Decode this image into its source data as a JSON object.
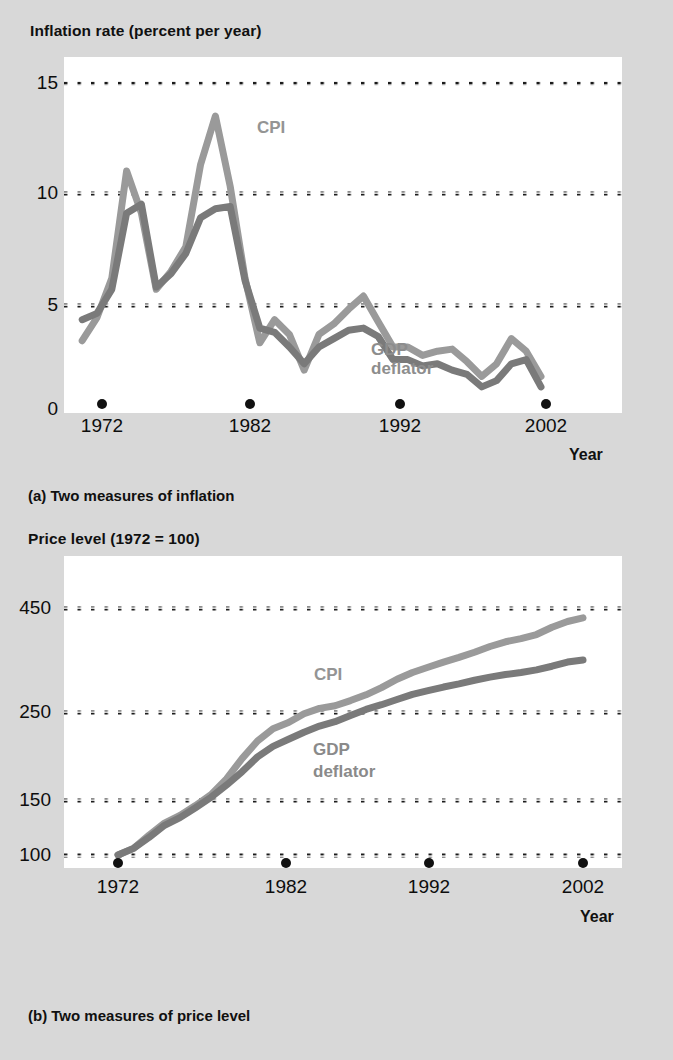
{
  "figure": {
    "background_color": "#d8d8d8",
    "plot_background": "#ffffff"
  },
  "panel_a": {
    "axis_title": "Inflation rate (percent per year)",
    "caption": "(a) Two measures of inflation",
    "x_axis_label": "Year",
    "y_ticks": [
      "15",
      "10",
      "5",
      "0"
    ],
    "x_ticks": [
      "1972",
      "1982",
      "1992",
      "2002"
    ],
    "series_labels": {
      "cpi": "CPI",
      "gdp_line1": "GDP",
      "gdp_line2": "deflator"
    }
  },
  "panel_b": {
    "axis_title": "Price level (1972 = 100)",
    "caption": "(b) Two measures of price level",
    "x_axis_label": "Year",
    "y_ticks": [
      "450",
      "250",
      "150",
      "100"
    ],
    "x_ticks": [
      "1972",
      "1982",
      "1992",
      "2002"
    ],
    "series_labels": {
      "cpi": "CPI",
      "gdp_line1": "GDP",
      "gdp_line2": "deflator"
    }
  },
  "colors": {
    "cpi": "#9a9a9a",
    "gdp_deflator": "#7a7a7a",
    "gridline": "#1a1a1a",
    "text": "#101010"
  },
  "chart_data": [
    {
      "type": "line",
      "title": "Inflation rate (percent per year)",
      "subtitle": "(a) Two measures of inflation",
      "xlabel": "Year",
      "ylabel": "Inflation rate (percent per year)",
      "xlim": [
        1971,
        2002
      ],
      "ylim": [
        0,
        15
      ],
      "yticks": [
        0,
        5,
        10,
        15
      ],
      "xticks": [
        1972,
        1982,
        1992,
        2002
      ],
      "grid": "horizontal-dotted",
      "legend": "inline-annotations",
      "x": [
        1971,
        1972,
        1973,
        1974,
        1975,
        1976,
        1977,
        1978,
        1979,
        1980,
        1981,
        1982,
        1983,
        1984,
        1985,
        1986,
        1987,
        1988,
        1989,
        1990,
        1991,
        1992,
        1993,
        1994,
        1995,
        1996,
        1997,
        1998,
        1999,
        2000,
        2001,
        2002
      ],
      "series": [
        {
          "name": "CPI",
          "color": "#9a9a9a",
          "values": [
            3.3,
            4.4,
            6.2,
            11.0,
            9.1,
            5.7,
            6.5,
            7.6,
            11.3,
            13.5,
            10.3,
            6.2,
            3.2,
            4.3,
            3.6,
            1.9,
            3.6,
            4.1,
            4.8,
            5.4,
            4.2,
            3.0,
            3.0,
            2.6,
            2.8,
            2.9,
            2.3,
            1.6,
            2.2,
            3.4,
            2.8,
            1.6
          ]
        },
        {
          "name": "GDP deflator",
          "color": "#7a7a7a",
          "values": [
            4.3,
            4.6,
            5.7,
            9.1,
            9.5,
            5.8,
            6.4,
            7.3,
            8.9,
            9.3,
            9.4,
            6.1,
            3.9,
            3.7,
            3.0,
            2.2,
            3.0,
            3.4,
            3.8,
            3.9,
            3.5,
            2.4,
            2.4,
            2.1,
            2.2,
            1.9,
            1.7,
            1.1,
            1.4,
            2.2,
            2.4,
            1.1
          ]
        }
      ]
    },
    {
      "type": "line",
      "title": "Price level (1972 = 100)",
      "subtitle": "(b) Two measures of price level",
      "xlabel": "Year",
      "ylabel": "Price level (1972 = 100)",
      "xlim": [
        1972,
        2002
      ],
      "ylim": [
        100,
        475
      ],
      "yticks": [
        100,
        150,
        250,
        450
      ],
      "xticks": [
        1972,
        1982,
        1992,
        2002
      ],
      "grid": "horizontal-dotted",
      "legend": "inline-annotations",
      "x": [
        1972,
        1973,
        1974,
        1975,
        1976,
        1977,
        1978,
        1979,
        1980,
        1981,
        1982,
        1983,
        1984,
        1985,
        1986,
        1987,
        1988,
        1989,
        1990,
        1991,
        1992,
        1993,
        1994,
        1995,
        1996,
        1997,
        1998,
        1999,
        2000,
        2001,
        2002
      ],
      "series": [
        {
          "name": "CPI",
          "color": "#9a9a9a",
          "values": [
            100,
            106,
            118,
            129,
            136,
            145,
            156,
            174,
            197,
            217,
            231,
            238,
            248,
            257,
            262,
            272,
            283,
            297,
            313,
            326,
            336,
            346,
            355,
            365,
            376,
            385,
            391,
            399,
            413,
            424,
            431
          ]
        },
        {
          "name": "GDP deflator",
          "color": "#7a7a7a",
          "values": [
            100,
            106,
            116,
            127,
            134,
            143,
            153,
            167,
            182,
            199,
            211,
            219,
            227,
            234,
            239,
            246,
            255,
            264,
            274,
            284,
            291,
            298,
            304,
            311,
            317,
            322,
            326,
            331,
            338,
            346,
            350
          ]
        }
      ]
    }
  ]
}
